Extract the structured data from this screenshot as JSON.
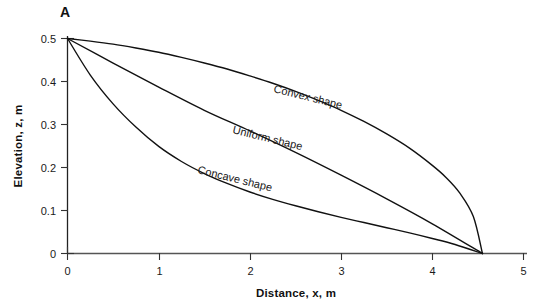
{
  "figure": {
    "panel_label": "A",
    "background_color": "#ffffff",
    "line_color": "#111111",
    "text_color": "#1a1a1a"
  },
  "chart_data": {
    "type": "line",
    "title": "",
    "subtitle": "",
    "xlabel": "Distance, x, m",
    "ylabel": "Elevation, z, m",
    "xlim": [
      0,
      5
    ],
    "ylim": [
      0,
      0.5
    ],
    "xticks": [
      "0",
      "1",
      "2",
      "3",
      "4",
      "5"
    ],
    "xtick_values": [
      0,
      1,
      2,
      3,
      4,
      5
    ],
    "yticks": [
      "0",
      "0.1",
      "0.2",
      "0.3",
      "0.4",
      "0.5"
    ],
    "ytick_values": [
      0,
      0.1,
      0.2,
      0.3,
      0.4,
      0.5
    ],
    "grid": false,
    "legend": "inline-curve-labels",
    "toe_x": 4.55,
    "crest_z": 0.5,
    "series": [
      {
        "name": "Convex shape",
        "label": "Convex shape",
        "x": [
          0.0,
          0.25,
          0.5,
          0.75,
          1.0,
          1.25,
          1.5,
          1.75,
          2.0,
          2.25,
          2.5,
          2.75,
          3.0,
          3.25,
          3.5,
          3.75,
          4.0,
          4.15,
          4.3,
          4.45,
          4.55
        ],
        "values": [
          0.5,
          0.494,
          0.487,
          0.478,
          0.468,
          0.456,
          0.443,
          0.429,
          0.413,
          0.396,
          0.377,
          0.356,
          0.333,
          0.307,
          0.278,
          0.245,
          0.205,
          0.177,
          0.141,
          0.086,
          0.0
        ]
      },
      {
        "name": "Uniform shape",
        "label": "Uniform shape",
        "x": [
          0.0,
          0.5,
          1.0,
          1.5,
          2.0,
          2.5,
          3.0,
          3.5,
          4.0,
          4.55
        ],
        "values": [
          0.5,
          0.443,
          0.387,
          0.333,
          0.285,
          0.235,
          0.182,
          0.127,
          0.069,
          0.0
        ]
      },
      {
        "name": "Concave shape",
        "label": "Concave shape",
        "x": [
          0.0,
          0.25,
          0.5,
          0.75,
          1.0,
          1.25,
          1.5,
          1.75,
          2.0,
          2.25,
          2.5,
          2.75,
          3.0,
          3.25,
          3.5,
          3.75,
          4.0,
          4.25,
          4.55
        ],
        "values": [
          0.5,
          0.415,
          0.348,
          0.294,
          0.249,
          0.214,
          0.186,
          0.163,
          0.143,
          0.126,
          0.111,
          0.097,
          0.084,
          0.072,
          0.06,
          0.048,
          0.035,
          0.021,
          0.0
        ]
      }
    ]
  }
}
